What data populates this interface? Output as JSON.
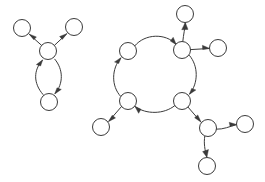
{
  "diagram": {
    "type": "directed-graph",
    "width": 265,
    "height": 182,
    "background_color": "#ffffff",
    "stroke_color": "#3a3a3a",
    "node_fill_color": "#ffffff",
    "node_radius": 8,
    "stroke_width": 1
  },
  "components": [
    {
      "id": "component-left",
      "name": "left-component",
      "node_count": 4,
      "edge_count": 4
    },
    {
      "id": "component-right",
      "name": "right-component",
      "node_count": 9,
      "edge_count": 10
    }
  ],
  "nodes": [
    {
      "id": "L1",
      "label": "",
      "component": "component-left",
      "cx": 22,
      "cy": 28,
      "r": 8.5
    },
    {
      "id": "L2",
      "label": "",
      "component": "component-left",
      "cx": 74,
      "cy": 27,
      "r": 8.5
    },
    {
      "id": "L3",
      "label": "",
      "component": "component-left",
      "cx": 48,
      "cy": 51,
      "r": 8.5
    },
    {
      "id": "L4",
      "label": "",
      "component": "component-left",
      "cx": 49,
      "cy": 102,
      "r": 8.5
    },
    {
      "id": "R_TL",
      "label": "",
      "component": "component-right",
      "cx": 128,
      "cy": 51,
      "r": 8.5
    },
    {
      "id": "R_TR",
      "label": "",
      "component": "component-right",
      "cx": 182,
      "cy": 50,
      "r": 8.5
    },
    {
      "id": "R_BR",
      "label": "",
      "component": "component-right",
      "cx": 182,
      "cy": 101,
      "r": 8.5
    },
    {
      "id": "R_BL",
      "label": "",
      "component": "component-right",
      "cx": 128,
      "cy": 101,
      "r": 8.5
    },
    {
      "id": "R_TOP",
      "label": "",
      "component": "component-right",
      "cx": 185,
      "cy": 14,
      "r": 8.5
    },
    {
      "id": "R_RIGHT",
      "label": "",
      "component": "component-right",
      "cx": 218,
      "cy": 48,
      "r": 8.5
    },
    {
      "id": "R_LEFT",
      "label": "",
      "component": "component-right",
      "cx": 101,
      "cy": 127,
      "r": 8.5
    },
    {
      "id": "R_HUB",
      "label": "",
      "component": "component-right",
      "cx": 208,
      "cy": 128,
      "r": 8.5
    },
    {
      "id": "R_FAR",
      "label": "",
      "component": "component-right",
      "cx": 245,
      "cy": 124,
      "r": 8.5
    },
    {
      "id": "R_BOT",
      "label": "",
      "component": "component-right",
      "cx": 207,
      "cy": 166,
      "r": 8.5
    }
  ],
  "edges": [
    {
      "id": "e1",
      "from": "L3",
      "to": "L1",
      "style": "straight",
      "arrow": true
    },
    {
      "id": "e2",
      "from": "L3",
      "to": "L2",
      "style": "straight",
      "arrow": true
    },
    {
      "id": "e3",
      "from": "L4",
      "to": "L3",
      "style": "curved-left",
      "arrow": true
    },
    {
      "id": "e4",
      "from": "L3",
      "to": "L4",
      "style": "curved-right",
      "arrow": true
    },
    {
      "id": "e5",
      "from": "R_TL",
      "to": "R_TR",
      "style": "arc-top",
      "arrow": true
    },
    {
      "id": "e6",
      "from": "R_TR",
      "to": "R_BR",
      "style": "arc-right",
      "arrow": true
    },
    {
      "id": "e7",
      "from": "R_BR",
      "to": "R_BL",
      "style": "arc-bottom",
      "arrow": true
    },
    {
      "id": "e8",
      "from": "R_BL",
      "to": "R_TL",
      "style": "arc-left",
      "arrow": true
    },
    {
      "id": "e9",
      "from": "R_TR",
      "to": "R_TOP",
      "style": "curved",
      "arrow": true
    },
    {
      "id": "e10",
      "from": "R_TR",
      "to": "R_RIGHT",
      "style": "straight",
      "arrow": true
    },
    {
      "id": "e11",
      "from": "R_BL",
      "to": "R_LEFT",
      "style": "straight",
      "arrow": true
    },
    {
      "id": "e12",
      "from": "R_BR",
      "to": "R_HUB",
      "style": "straight",
      "arrow": true
    },
    {
      "id": "e13",
      "from": "R_HUB",
      "to": "R_FAR",
      "style": "curved",
      "arrow": true
    },
    {
      "id": "e14",
      "from": "R_HUB",
      "to": "R_BOT",
      "style": "curved",
      "arrow": true
    }
  ]
}
